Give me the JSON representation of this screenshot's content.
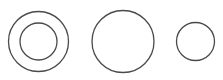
{
  "diagram": {
    "stroke_color": "#4a4a4a",
    "stroke_width": 1.3,
    "background": "#ffffff",
    "shapes": [
      {
        "name": "concentric-circles-outer",
        "cx": 38.5,
        "cy": 41.5,
        "r": 30
      },
      {
        "name": "concentric-circles-inner",
        "cx": 38.5,
        "cy": 41.5,
        "r": 18.5
      },
      {
        "name": "large-circle",
        "cx": 123,
        "cy": 41.5,
        "r": 31
      },
      {
        "name": "small-circle",
        "cx": 195.5,
        "cy": 41.5,
        "r": 19
      }
    ]
  }
}
